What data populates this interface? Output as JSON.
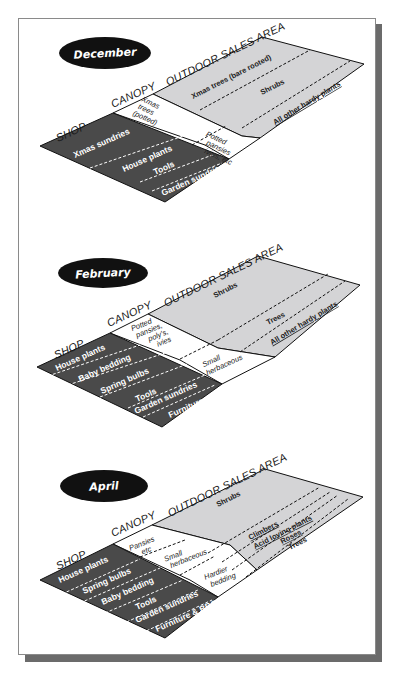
{
  "colors": {
    "shop": "#4a4a4a",
    "canopy": "#ffffff",
    "outdoor": "#d4d4d6",
    "ellipse": "#111111",
    "shadow": "#6b6b6b"
  },
  "headers": {
    "shop": "SHOP",
    "canopy": "CANOPY",
    "outdoor": "OUTDOOR SALES AREA"
  },
  "diagrams": [
    {
      "month": "December",
      "shop": [
        "Xmas sundries",
        "House plants",
        "Tools",
        "Garden sundries"
      ],
      "canopy": [
        "Xmas trees (potted)",
        "Potted pansies ivies, etc"
      ],
      "canopy_lines": {
        "xmas": [
          "Xmas",
          "trees",
          "(potted)"
        ],
        "pansies": [
          "Potted",
          "pansies",
          "ivies, etc"
        ]
      },
      "outdoor": [
        "Xmas trees (bare rooted)",
        "Shrubs",
        "All other hardy plants"
      ]
    },
    {
      "month": "February",
      "shop": [
        "House plants",
        "Baby bedding",
        "Spring bulbs",
        "Tools",
        "Garden sundries",
        "Furniture"
      ],
      "canopy": [
        "Potted pansies, poly's, ivies",
        "Small herbaceous"
      ],
      "canopy_lines": {
        "potted": [
          "Potted",
          "pansies,",
          "poly's,",
          "ivies"
        ],
        "small": [
          "Small",
          "herbaceous"
        ]
      },
      "outdoor": [
        "Shrubs",
        "Trees",
        "All other hardy plants"
      ]
    },
    {
      "month": "April",
      "shop": [
        "House plants",
        "Spring bulbs",
        "Baby bedding",
        "Tools",
        "Garden sundries",
        "Furniture & BBQs"
      ],
      "canopy": [
        "Pansies etc",
        "Small herbaceous",
        "Hardier bedding"
      ],
      "canopy_lines": {
        "pansies": [
          "Pansies",
          "etc"
        ],
        "small": [
          "Small",
          "herbaceous"
        ],
        "hardier": [
          "Hardier",
          "bedding"
        ]
      },
      "outdoor": [
        "Shrubs",
        "Climbers",
        "Acid loving plants",
        "Roses",
        "Trees"
      ]
    }
  ]
}
